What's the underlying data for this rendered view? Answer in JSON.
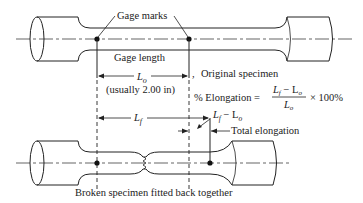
{
  "diagram": {
    "labels": {
      "gage_marks": "Gage marks",
      "gage_length": "Gage length",
      "lo_symbol": "L",
      "lo_sub": "o",
      "lo_note": "(usually 2.00 in)",
      "original_specimen": "Original specimen",
      "elongation_prefix": "% Elongation =",
      "formula_numerator": "L",
      "formula_num_sub_f": "f",
      "formula_num_minus": " − L",
      "formula_num_sub_o": "o",
      "formula_denominator": "L",
      "formula_den_sub": "o",
      "formula_suffix": "× 100%",
      "lf_symbol": "L",
      "lf_sub": "f",
      "diff_symbol": "L",
      "diff_sub_f": "f",
      "diff_minus": " − L",
      "diff_sub_o": "o",
      "total_elongation": "Total elongation",
      "caption": "Broken specimen fitted back together"
    }
  }
}
